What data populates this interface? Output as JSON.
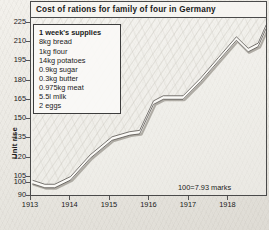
{
  "title": "Cost of rations for family of four in Germany",
  "annotation": "100=7.93 marks",
  "legend": {
    "title": "1 week's supplies",
    "items": [
      "8kg bread",
      "1kg flour",
      "14kg potatoes",
      "0.9kg sugar",
      "0.3kg butter",
      "0.975kg meat",
      "5.5l milk",
      "2 eggs"
    ]
  },
  "chart_data": {
    "type": "line",
    "title": "Cost of rations for family of four in Germany",
    "xlabel": "",
    "ylabel": "Unit rise",
    "ylim": [
      90,
      228
    ],
    "xlim": [
      1913.0,
      1918.95
    ],
    "grid": false,
    "legend_position": "upper-left-inset",
    "annotations": [
      "100=7.93 marks"
    ],
    "ytick_labels": [
      "225",
      "210",
      "195",
      "180",
      "165",
      "150",
      "135",
      "120",
      "105",
      "100",
      "90"
    ],
    "ytick_values": [
      225,
      210,
      195,
      180,
      165,
      150,
      135,
      120,
      105,
      100,
      90
    ],
    "xtick_labels": [
      "1913",
      "1914",
      "1915",
      "1916",
      "1917",
      "1918"
    ],
    "xtick_values": [
      1913,
      1914,
      1915,
      1916,
      1917,
      1918
    ],
    "series": [
      {
        "name": "Cost of rations (index, 100 = 7.93 marks)",
        "x": [
          1913.05,
          1913.35,
          1913.6,
          1914.0,
          1914.5,
          1915.05,
          1915.5,
          1915.75,
          1916.1,
          1916.35,
          1916.85,
          1917.3,
          1917.75,
          1918.2,
          1918.5,
          1918.75,
          1918.95
        ],
        "values": [
          100,
          97,
          97,
          103,
          120,
          134,
          138,
          139,
          162,
          166,
          166,
          180,
          196,
          212,
          203,
          207,
          221
        ]
      }
    ]
  },
  "axis": {
    "y_label": "Unit rise"
  }
}
